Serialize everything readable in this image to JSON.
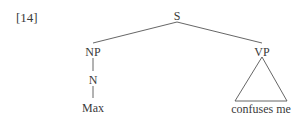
{
  "example_number": "[14]",
  "tree": {
    "root": {
      "label": "S"
    },
    "np": {
      "label": "NP"
    },
    "n": {
      "label": "N"
    },
    "leaf_np": {
      "label": "Max"
    },
    "vp": {
      "label": "VP"
    },
    "leaf_vp": {
      "label": "confuses me"
    }
  }
}
